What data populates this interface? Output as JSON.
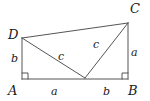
{
  "figure": {
    "background_color": "#ffffff",
    "stroke_color": "#555555",
    "label_color": "#1a1a1a",
    "canvas": {
      "width": 150,
      "height": 101
    },
    "vertices": [
      {
        "name": "A",
        "label": "A",
        "x": 22,
        "y": 79
      },
      {
        "name": "B",
        "label": "B",
        "x": 128,
        "y": 79
      },
      {
        "name": "C",
        "label": "C",
        "x": 128,
        "y": 23
      },
      {
        "name": "D",
        "label": "D",
        "x": 22,
        "y": 38
      },
      {
        "name": "P",
        "label": "",
        "x": 85,
        "y": 78
      }
    ],
    "edges": [
      {
        "name": "edge-AB",
        "from": "A",
        "to": "B"
      },
      {
        "name": "edge-BC",
        "from": "B",
        "to": "C"
      },
      {
        "name": "edge-CD",
        "from": "C",
        "to": "D"
      },
      {
        "name": "edge-DA",
        "from": "D",
        "to": "A"
      },
      {
        "name": "edge-DP",
        "from": "D",
        "to": "P"
      },
      {
        "name": "edge-PC",
        "from": "P",
        "to": "C"
      }
    ],
    "right_angles": [
      {
        "name": "right-angle-A",
        "at": "A",
        "size": 6
      },
      {
        "name": "right-angle-B",
        "at": "B",
        "size": 6
      }
    ],
    "vertex_labels": {
      "D": "D",
      "C": "C",
      "A": "A",
      "B": "B"
    },
    "side_labels": {
      "left_AD": "b",
      "right_CB": "a",
      "bottom_AP": "a",
      "bottom_PB": "b",
      "hyp_DP": "c",
      "hyp_PC": "c"
    }
  }
}
